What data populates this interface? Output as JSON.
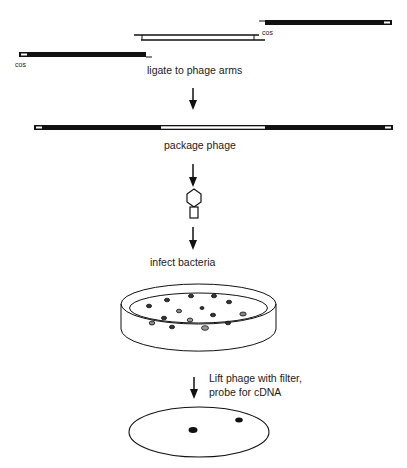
{
  "figure": {
    "steps": [
      {
        "id": "ligate",
        "label": "ligate to phage arms"
      },
      {
        "id": "package",
        "label": "package phage"
      },
      {
        "id": "infect",
        "label": "infect bacteria"
      },
      {
        "id": "lift",
        "label_line1": "Lift phage with filter,",
        "label_line2": "probe for cDNA"
      }
    ],
    "labels": {
      "cos_left": "cos",
      "cos_right": "cos"
    },
    "colors": {
      "ink": "#111111",
      "background": "#ffffff"
    },
    "elements": {
      "left_arm": "black bar with cos end (left)",
      "insert": "double-stranded cDNA insert (open bar)",
      "right_arm": "black bar with cos end (right)",
      "recombinant_dna": "ligated phage DNA with central insert",
      "phage": "phage particle icon (hexagonal head + tail)",
      "petri_dish": "petri dish with plaques",
      "filter": "filter replica with two positive spots"
    },
    "plaque_count": 16,
    "positive_spots": 2
  }
}
